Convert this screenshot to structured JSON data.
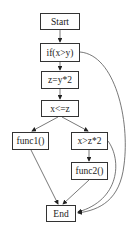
{
  "diagram": {
    "type": "control-flow-graph",
    "nodes": [
      {
        "id": "start",
        "label": "Start"
      },
      {
        "id": "if",
        "label": "if(x>y)"
      },
      {
        "id": "assign",
        "label": "z=y*2"
      },
      {
        "id": "cond1",
        "label": "x<=z"
      },
      {
        "id": "func1",
        "label": "func1()"
      },
      {
        "id": "cond2",
        "label": "x>z*2"
      },
      {
        "id": "func2",
        "label": "func2()"
      },
      {
        "id": "end",
        "label": "End"
      }
    ],
    "edges": [
      {
        "from": "start",
        "to": "if"
      },
      {
        "from": "if",
        "to": "assign"
      },
      {
        "from": "if",
        "to": "end"
      },
      {
        "from": "assign",
        "to": "cond1"
      },
      {
        "from": "cond1",
        "to": "func1"
      },
      {
        "from": "cond1",
        "to": "cond2"
      },
      {
        "from": "func1",
        "to": "end"
      },
      {
        "from": "cond2",
        "to": "func2"
      },
      {
        "from": "cond2",
        "to": "end"
      },
      {
        "from": "func2",
        "to": "end"
      }
    ],
    "colors": {
      "stroke": "#333333",
      "edge": "#555555",
      "background": "#ffffff"
    }
  }
}
